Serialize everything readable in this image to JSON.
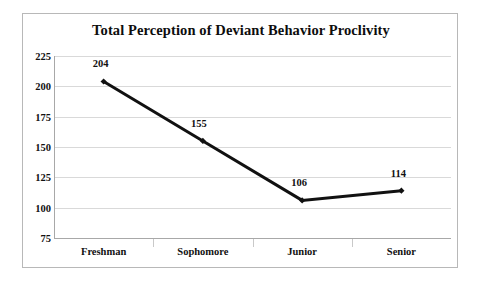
{
  "chart_data": {
    "type": "line",
    "title": "Total Perception of Deviant Behavior Proclivity",
    "xlabel": "",
    "ylabel": "",
    "categories": [
      "Freshman",
      "Sophomore",
      "Junior",
      "Senior"
    ],
    "values": [
      204,
      155,
      106,
      114
    ],
    "point_labels": [
      "204",
      "155",
      "106",
      "114"
    ],
    "ylim": [
      75,
      225
    ],
    "yticks": [
      225,
      200,
      175,
      150,
      125,
      100,
      75
    ],
    "ytick_labels": [
      "225",
      "200",
      "175",
      "150",
      "125",
      "100",
      "75"
    ],
    "grid": true,
    "legend": "none",
    "series_color": "#111111",
    "grid_color": "#d9d9d9",
    "axis_color": "#a8a8a8",
    "background": "#ffffff",
    "marker": "diamond",
    "line_width": 3
  }
}
